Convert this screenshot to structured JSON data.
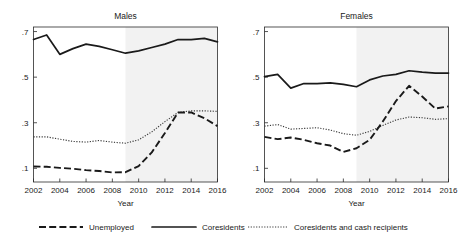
{
  "chart_data": {
    "type": "line",
    "title": "",
    "xlabel": "Year",
    "ylabel": "",
    "xlim": [
      2002,
      2016
    ],
    "ylim": [
      0.04,
      0.72
    ],
    "x": [
      2002,
      2003,
      2004,
      2005,
      2006,
      2007,
      2008,
      2009,
      2010,
      2011,
      2012,
      2013,
      2014,
      2015,
      2016
    ],
    "yticks": [
      0.1,
      0.3,
      0.5,
      0.7
    ],
    "ytick_labels": [
      ".1",
      ".3",
      ".5",
      ".7"
    ],
    "xticks": [
      2002,
      2004,
      2006,
      2008,
      2010,
      2012,
      2014,
      2016
    ],
    "xtick_labels": [
      "2002",
      "2004",
      "2006",
      "2008",
      "2010",
      "2012",
      "2014",
      "2016"
    ],
    "grid": false,
    "legend_position": "bottom",
    "shaded_region": {
      "from": 2009,
      "to": 2016,
      "color": "#f2f2f2"
    },
    "panels": [
      {
        "label": "Males",
        "series": [
          {
            "name": "Unemployed",
            "style": "long-dash",
            "color": "#1a1a1a",
            "values": [
              0.108,
              0.107,
              0.102,
              0.098,
              0.092,
              0.088,
              0.082,
              0.083,
              0.11,
              0.17,
              0.255,
              0.345,
              0.345,
              0.32,
              0.285
            ]
          },
          {
            "name": "Coresidents",
            "style": "solid",
            "color": "#1a1a1a",
            "values": [
              0.665,
              0.685,
              0.6,
              0.625,
              0.645,
              0.635,
              0.62,
              0.605,
              0.615,
              0.63,
              0.645,
              0.665,
              0.665,
              0.67,
              0.655
            ]
          },
          {
            "name": "Coresidents and cash recipients",
            "style": "dotted",
            "color": "#3a3a3a",
            "values": [
              0.238,
              0.238,
              0.228,
              0.218,
              0.215,
              0.222,
              0.215,
              0.21,
              0.225,
              0.26,
              0.305,
              0.345,
              0.352,
              0.352,
              0.35
            ]
          }
        ]
      },
      {
        "label": "Females",
        "series": [
          {
            "name": "Unemployed",
            "style": "long-dash",
            "color": "#1a1a1a",
            "values": [
              0.238,
              0.228,
              0.235,
              0.225,
              0.21,
              0.2,
              0.172,
              0.188,
              0.225,
              0.305,
              0.395,
              0.462,
              0.415,
              0.362,
              0.372
            ]
          },
          {
            "name": "Coresidents",
            "style": "solid",
            "color": "#1a1a1a",
            "values": [
              0.502,
              0.512,
              0.452,
              0.472,
              0.472,
              0.475,
              0.468,
              0.458,
              0.488,
              0.505,
              0.512,
              0.528,
              0.522,
              0.518,
              0.518
            ]
          },
          {
            "name": "Coresidents and cash recipients",
            "style": "dotted",
            "color": "#3a3a3a",
            "values": [
              0.285,
              0.292,
              0.272,
              0.275,
              0.278,
              0.268,
              0.252,
              0.245,
              0.262,
              0.288,
              0.312,
              0.325,
              0.322,
              0.315,
              0.318
            ]
          }
        ]
      }
    ],
    "legend": [
      {
        "label": "Unemployed",
        "style": "long-dash",
        "color": "#1a1a1a"
      },
      {
        "label": "Coresidents",
        "style": "solid",
        "color": "#1a1a1a"
      },
      {
        "label": "Coresidents and cash recipients",
        "style": "dotted",
        "color": "#3a3a3a"
      }
    ]
  }
}
